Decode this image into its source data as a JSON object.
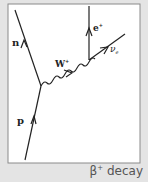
{
  "diagram": {
    "type": "feynman",
    "caption": {
      "symbol": "β",
      "superscript": "+",
      "text": "decay"
    },
    "particles": {
      "proton": {
        "label": "p"
      },
      "neutron": {
        "label": "n"
      },
      "w_boson": {
        "label": "W",
        "superscript": "+"
      },
      "positron": {
        "label": "e",
        "superscript": "+"
      },
      "neutrino": {
        "label": "ν",
        "subscript": "e"
      }
    },
    "colors": {
      "background": "#e4e4e4",
      "panel": "#ffffff",
      "border": "#8a8a8a",
      "line": "#222222",
      "caption": "#555555"
    }
  }
}
